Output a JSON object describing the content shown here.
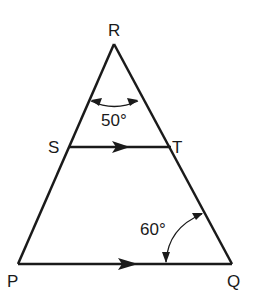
{
  "diagram": {
    "type": "geometry-triangle",
    "vertices": {
      "R": {
        "label": "R"
      },
      "S": {
        "label": "S"
      },
      "T": {
        "label": "T"
      },
      "P": {
        "label": "P"
      },
      "Q": {
        "label": "Q"
      }
    },
    "angles": {
      "apex": {
        "label": "50°",
        "at": "R"
      },
      "base": {
        "label": "60°",
        "at": "Q"
      }
    },
    "parallel_segments": [
      "ST",
      "PQ"
    ],
    "colors": {
      "stroke": "#1a1a1a",
      "background": "#ffffff"
    }
  }
}
